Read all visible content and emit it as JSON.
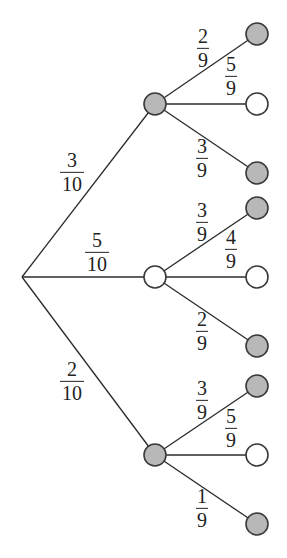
{
  "diagram": {
    "type": "probability-tree",
    "colors": {
      "edge": "#2b2b2b",
      "shaded_fill": "#b8b8b8",
      "unshaded_fill": "#ffffff",
      "outline": "#3a3a3a"
    },
    "root": {
      "x": 22,
      "y": 277
    },
    "level1": [
      {
        "id": "A",
        "shaded": true,
        "x": 155,
        "y": 104,
        "label": {
          "num": "3",
          "den": "10",
          "x": 72,
          "y": 172
        },
        "children": [
          {
            "shaded": true,
            "x": 257,
            "y": 34,
            "label": {
              "num": "2",
              "den": "9",
              "x": 203,
              "y": 48
            }
          },
          {
            "shaded": false,
            "x": 257,
            "y": 104,
            "label": {
              "num": "5",
              "den": "9",
              "x": 231,
              "y": 76
            }
          },
          {
            "shaded": true,
            "x": 257,
            "y": 173,
            "label": {
              "num": "3",
              "den": "9",
              "x": 202,
              "y": 158
            }
          }
        ]
      },
      {
        "id": "B",
        "shaded": false,
        "x": 155,
        "y": 277,
        "label": {
          "num": "5",
          "den": "10",
          "x": 97,
          "y": 252
        },
        "children": [
          {
            "shaded": true,
            "x": 257,
            "y": 208,
            "label": {
              "num": "3",
              "den": "9",
              "x": 202,
              "y": 222
            }
          },
          {
            "shaded": false,
            "x": 257,
            "y": 277,
            "label": {
              "num": "4",
              "den": "9",
              "x": 231,
              "y": 249
            }
          },
          {
            "shaded": true,
            "x": 257,
            "y": 346,
            "label": {
              "num": "2",
              "den": "9",
              "x": 202,
              "y": 331
            }
          }
        ]
      },
      {
        "id": "C",
        "shaded": true,
        "x": 155,
        "y": 455,
        "label": {
          "num": "2",
          "den": "10",
          "x": 72,
          "y": 381
        },
        "children": [
          {
            "shaded": true,
            "x": 257,
            "y": 386,
            "label": {
              "num": "3",
              "den": "9",
              "x": 202,
              "y": 400
            }
          },
          {
            "shaded": false,
            "x": 257,
            "y": 455,
            "label": {
              "num": "5",
              "den": "9",
              "x": 231,
              "y": 428
            }
          },
          {
            "shaded": true,
            "x": 257,
            "y": 524,
            "label": {
              "num": "1",
              "den": "9",
              "x": 202,
              "y": 508
            }
          }
        ]
      }
    ],
    "node_radius": 11
  }
}
